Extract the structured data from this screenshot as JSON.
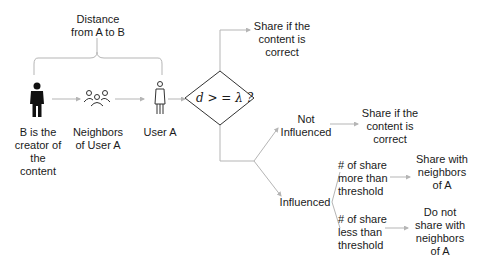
{
  "diagram": {
    "distance_label": [
      "Distance",
      "from A to B"
    ],
    "nodes": {
      "creator": {
        "icon": "person-filled-icon",
        "label": [
          "B is the",
          "creator of",
          "the",
          "content"
        ]
      },
      "neighbors": {
        "icon": "group-icon",
        "label": [
          "Neighbors",
          "of User A"
        ]
      },
      "user_a": {
        "icon": "person-outline-icon",
        "label": [
          "User A"
        ]
      }
    },
    "decision": {
      "text": "d > = λ ?"
    },
    "outcomes": {
      "top": [
        "Share if the",
        "content is",
        "correct"
      ],
      "not_influenced": [
        "Not",
        "Influenced"
      ],
      "not_influenced_result": [
        "Share if the",
        "content is",
        "correct"
      ],
      "influenced": [
        "Influenced"
      ],
      "more_than": [
        "# of share",
        "more than",
        "threshold"
      ],
      "more_than_result": [
        "Share with",
        "neighbors",
        "of A"
      ],
      "less_than": [
        "# of share",
        "less than",
        "threshold"
      ],
      "less_than_result": [
        "Do not",
        "share with",
        "neighbors",
        "of A"
      ]
    },
    "colors": {
      "line": "#b5b5b5",
      "text": "#1a1a1a",
      "icon": "#111111"
    }
  }
}
